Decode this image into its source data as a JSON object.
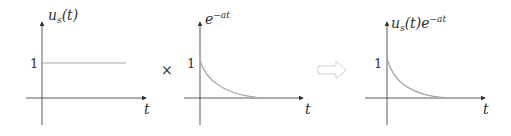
{
  "plots": [
    {
      "id": "unit-step",
      "y_label": "u",
      "y_label_sub": "s",
      "y_label_rest": "(t)",
      "x_label": "t",
      "tick_label": "1"
    },
    {
      "id": "exponential",
      "y_label": "e",
      "y_label_sup": "−at",
      "x_label": "t",
      "tick_label": "1"
    },
    {
      "id": "product",
      "y_label": "u",
      "y_label_sub": "s",
      "y_label_rest": "(t)e",
      "y_label_sup": "−at",
      "x_label": "t",
      "tick_label": "1"
    }
  ],
  "operators": {
    "multiply": "×",
    "implies": "⇨"
  },
  "colors": {
    "axis": "#333333",
    "curve": "#a8a8a8",
    "arrow": "#d0d0d0"
  }
}
